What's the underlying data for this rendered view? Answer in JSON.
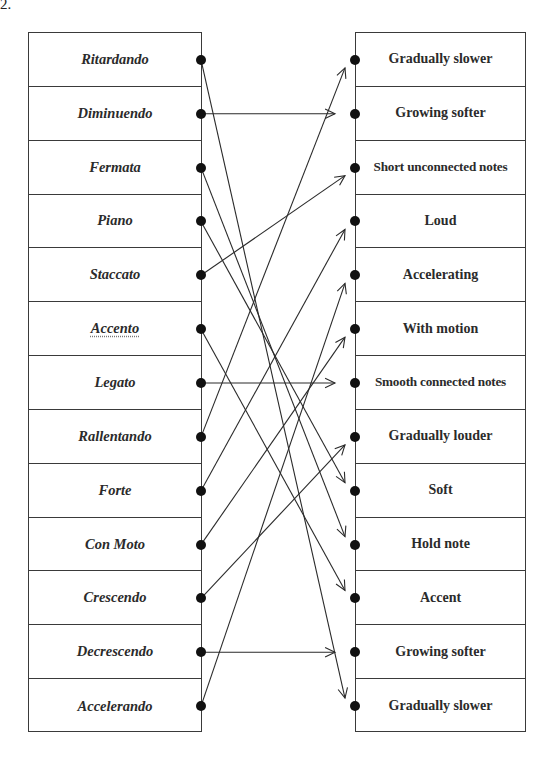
{
  "question_number": "2.",
  "left_terms": [
    {
      "label": "Ritardando",
      "spellcheck": false
    },
    {
      "label": "Diminuendo",
      "spellcheck": false
    },
    {
      "label": "Fermata",
      "spellcheck": false
    },
    {
      "label": "Piano",
      "spellcheck": false
    },
    {
      "label": "Staccato",
      "spellcheck": false
    },
    {
      "label": "Accento",
      "spellcheck": true
    },
    {
      "label": "Legato",
      "spellcheck": false
    },
    {
      "label": "Rallentando",
      "spellcheck": false
    },
    {
      "label": "Forte",
      "spellcheck": false
    },
    {
      "label": "Con Moto",
      "spellcheck": false
    },
    {
      "label": "Crescendo",
      "spellcheck": false
    },
    {
      "label": "Decrescendo",
      "spellcheck": false
    },
    {
      "label": "Accelerando",
      "spellcheck": false
    }
  ],
  "right_meanings": [
    {
      "label": "Gradually slower"
    },
    {
      "label": "Growing softer"
    },
    {
      "label": "Short unconnected notes"
    },
    {
      "label": "Loud"
    },
    {
      "label": "Accelerating"
    },
    {
      "label": "With motion"
    },
    {
      "label": "Smooth connected notes"
    },
    {
      "label": "Gradually louder"
    },
    {
      "label": "Soft"
    },
    {
      "label": "Hold note"
    },
    {
      "label": "Accent"
    },
    {
      "label": "Growing softer"
    },
    {
      "label": "Gradually slower"
    }
  ],
  "connections": [
    {
      "from": "Ritardando",
      "from_index": 0,
      "to": "Gradually slower",
      "to_index": 12
    },
    {
      "from": "Diminuendo",
      "from_index": 1,
      "to": "Growing softer",
      "to_index": 1
    },
    {
      "from": "Fermata",
      "from_index": 2,
      "to": "Hold note",
      "to_index": 9
    },
    {
      "from": "Piano",
      "from_index": 3,
      "to": "Soft",
      "to_index": 8
    },
    {
      "from": "Staccato",
      "from_index": 4,
      "to": "Short unconnected notes",
      "to_index": 2
    },
    {
      "from": "Accento",
      "from_index": 5,
      "to": "Accent",
      "to_index": 10
    },
    {
      "from": "Legato",
      "from_index": 6,
      "to": "Smooth connected notes",
      "to_index": 6
    },
    {
      "from": "Rallentando",
      "from_index": 7,
      "to": "Gradually slower",
      "to_index": 0
    },
    {
      "from": "Forte",
      "from_index": 8,
      "to": "Loud",
      "to_index": 3
    },
    {
      "from": "Con Moto",
      "from_index": 9,
      "to": "With motion",
      "to_index": 5
    },
    {
      "from": "Crescendo",
      "from_index": 10,
      "to": "Gradually louder",
      "to_index": 7
    },
    {
      "from": "Decrescendo",
      "from_index": 11,
      "to": "Growing softer",
      "to_index": 11
    },
    {
      "from": "Accelerando",
      "from_index": 12,
      "to": "Accelerating",
      "to_index": 4
    }
  ],
  "colors": {
    "line": "#2a2a2a",
    "dot": "#111111",
    "border": "#3a3a3a"
  }
}
